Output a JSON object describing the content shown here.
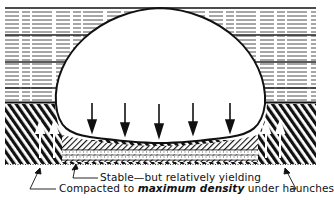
{
  "diagram": {
    "colors": {
      "ink": "#111111",
      "background": "#ffffff"
    },
    "labels": {
      "bedding": "Stable—but relatively yielding",
      "haunches_prefix": "Compacted to ",
      "haunches_emphasis": "maximum density",
      "haunches_suffix": " under haunches"
    },
    "load_arrows": {
      "count": 5,
      "direction": "down"
    },
    "haunch_arrows": {
      "count": 4,
      "direction": "up"
    }
  }
}
